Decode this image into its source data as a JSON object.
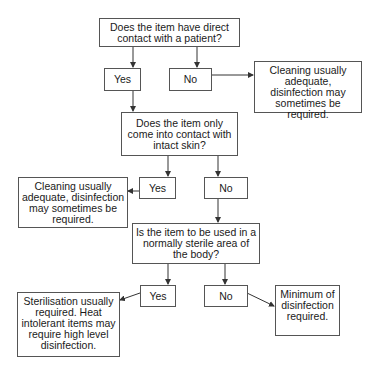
{
  "diagram": {
    "q1": {
      "text": "Does the item have direct contact with a patient?"
    },
    "q1_yes": {
      "text": "Yes"
    },
    "q1_no": {
      "text": "No"
    },
    "q1_no_result": {
      "text": "Cleaning usually adequate, disinfection may sometimes be required."
    },
    "q2": {
      "text": "Does the item only come into contact with intact skin?"
    },
    "q2_yes": {
      "text": "Yes"
    },
    "q2_no": {
      "text": "No"
    },
    "q2_yes_result": {
      "text": "Cleaning usually adequate, disinfection may sometimes be required."
    },
    "q3": {
      "text": "Is the item to be used in a normally sterile area of the body?"
    },
    "q3_yes": {
      "text": "Yes"
    },
    "q3_no": {
      "text": "No"
    },
    "q3_yes_result": {
      "text": "Sterilisation usually required. Heat intolerant items may require high level disinfection."
    },
    "q3_no_result": {
      "text": "Minimum of disinfection required."
    },
    "colors": {
      "line": "#333333",
      "border": "#555555",
      "text": "#1a1a1a",
      "background": "#ffffff"
    }
  }
}
